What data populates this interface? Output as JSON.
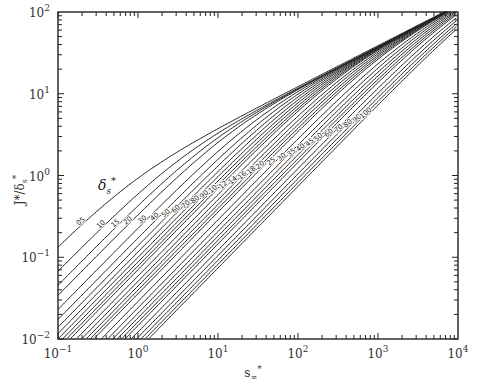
{
  "chart_data": {
    "type": "line",
    "title": "",
    "xlabel": "s∞*",
    "ylabel": "J*/δs*",
    "xscale": "log",
    "yscale": "log",
    "xlim": [
      0.1,
      10000
    ],
    "ylim": [
      0.01,
      100
    ],
    "x_ticks": [
      "10-1",
      "100",
      "101",
      "102",
      "103",
      "104"
    ],
    "y_ticks": [
      "10-2",
      "10-1",
      "100",
      "101",
      "102"
    ],
    "grid": false,
    "legend": "none",
    "curve_parameter_label": "δs*",
    "series": [
      {
        "name": "0.5",
        "label": "05",
        "left_y": 0.133,
        "exit_top_x": 1230
      },
      {
        "name": "1.0",
        "label": "10",
        "left_y": 0.068,
        "exit_top_x": 5000
      },
      {
        "name": "1.5",
        "label": "15",
        "left_y": 0.045
      },
      {
        "name": "2.0",
        "label": "20",
        "left_y": 0.034
      },
      {
        "name": "3.0",
        "label": "30",
        "left_y": 0.023
      },
      {
        "name": "4.0",
        "label": "40",
        "left_y": 0.017
      },
      {
        "name": "5.0",
        "label": "50",
        "left_y": 0.014
      },
      {
        "name": "6.0",
        "label": "60",
        "left_y": 0.012
      },
      {
        "name": "7.0",
        "label": "70"
      },
      {
        "name": "8.0",
        "label": "80"
      },
      {
        "name": "9.0",
        "label": "90"
      },
      {
        "name": "10",
        "label": "10"
      },
      {
        "name": "12",
        "label": "12"
      },
      {
        "name": "14",
        "label": "14"
      },
      {
        "name": "16",
        "label": "16"
      },
      {
        "name": "18",
        "label": "18"
      },
      {
        "name": "20",
        "label": "20"
      },
      {
        "name": "25",
        "label": "25"
      },
      {
        "name": "30",
        "label": "30"
      },
      {
        "name": "35",
        "label": "35"
      },
      {
        "name": "40",
        "label": "40"
      },
      {
        "name": "45",
        "label": "45"
      },
      {
        "name": "50",
        "label": "50"
      },
      {
        "name": "60",
        "label": "60"
      },
      {
        "name": "70",
        "label": "70"
      },
      {
        "name": "80",
        "label": "80"
      },
      {
        "name": "90",
        "label": "90"
      },
      {
        "name": "100",
        "label": "100",
        "right_y": 0.18
      }
    ]
  },
  "labels": {
    "ylabel": "J*/δs*",
    "xlabel": "s∞*",
    "param": "δs*"
  }
}
